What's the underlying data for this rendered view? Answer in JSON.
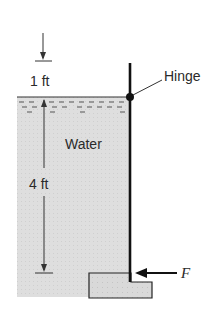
{
  "figure": {
    "labels": {
      "top_dimension": "1 ft",
      "depth_dimension": "4 ft",
      "fluid": "Water",
      "hinge": "Hinge",
      "force": "F"
    },
    "colors": {
      "water_fill": "#dcdcdc",
      "line": "#1a1a1a",
      "block_fill": "#d6d6d6"
    }
  }
}
